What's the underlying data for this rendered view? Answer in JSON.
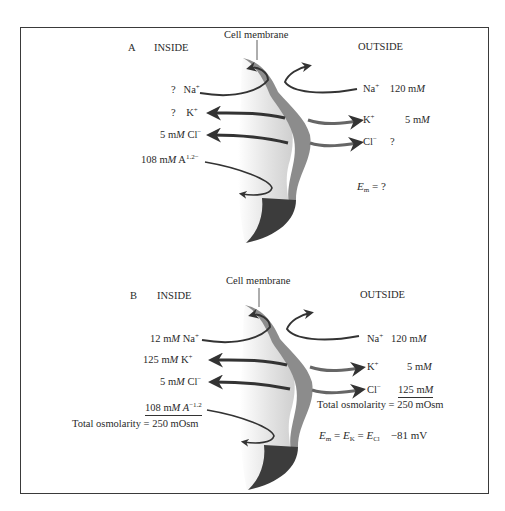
{
  "figure": {
    "panels": [
      {
        "id": "A",
        "letter": "A",
        "inside_heading": "INSIDE",
        "outside_heading": "OUTSIDE",
        "membrane_label": "Cell membrane",
        "inside": {
          "na": {
            "conc": "?",
            "ion": "Na",
            "charge": "+"
          },
          "k": {
            "conc": "?",
            "ion": "K",
            "charge": "+"
          },
          "cl": {
            "conc_num": "5 m",
            "conc_unit": "M",
            "ion": " Cl",
            "charge": "−"
          },
          "a": {
            "conc_num": "108 m",
            "conc_unit": "M",
            "ion": " A",
            "charge": "1.2−"
          }
        },
        "outside": {
          "na": {
            "ion": "Na",
            "charge": "+",
            "conc_num": "120 m",
            "conc_unit": "M"
          },
          "k": {
            "ion": "K",
            "charge": "+",
            "conc_num": "5 m",
            "conc_unit": "M"
          },
          "cl": {
            "ion": "Cl",
            "charge": "−",
            "conc": "?"
          }
        },
        "potential": {
          "E": "E",
          "sub": "m",
          "rest": " = ?"
        }
      },
      {
        "id": "B",
        "letter": "B",
        "inside_heading": "INSIDE",
        "outside_heading": "OUTSIDE",
        "membrane_label": "Cell membrane",
        "inside": {
          "na": {
            "conc_num": "12 m",
            "conc_unit": "M",
            "ion": " Na",
            "charge": "+"
          },
          "k": {
            "conc_num": "125 m",
            "conc_unit": "M",
            "ion": " K",
            "charge": "+"
          },
          "cl": {
            "conc_num": "5 m",
            "conc_unit": "M",
            "ion": " Cl",
            "charge": "−"
          },
          "a": {
            "conc_num": "108 m",
            "conc_unit": "M",
            "ion": " A",
            "charge": "−1.2"
          },
          "total_osmolarity": "Total osmolarity = 250 mOsm"
        },
        "outside": {
          "na": {
            "ion": "Na",
            "charge": "+",
            "conc_num": "120 m",
            "conc_unit": "M"
          },
          "k": {
            "ion": "K",
            "charge": "+",
            "conc_num": "5 m",
            "conc_unit": "M"
          },
          "cl": {
            "ion": "Cl",
            "charge": "−",
            "conc_num": "125 m",
            "conc_unit": "M"
          },
          "total_osmolarity": "Total osmolarity = 250 mOsm"
        },
        "potential": {
          "E1": "E",
          "sub1": "m",
          "eq1": " = ",
          "E2": "E",
          "sub2": "K",
          "eq2": " = ",
          "E3": "E",
          "sub3": "Cl",
          "value": "−81 mV"
        }
      }
    ],
    "colors": {
      "frame": "#3a3a3a",
      "membrane_light": "#e6e6e6",
      "membrane_mid": "#8c8c8c",
      "membrane_dark": "#3c3c3c",
      "arrow": "#333333"
    }
  }
}
